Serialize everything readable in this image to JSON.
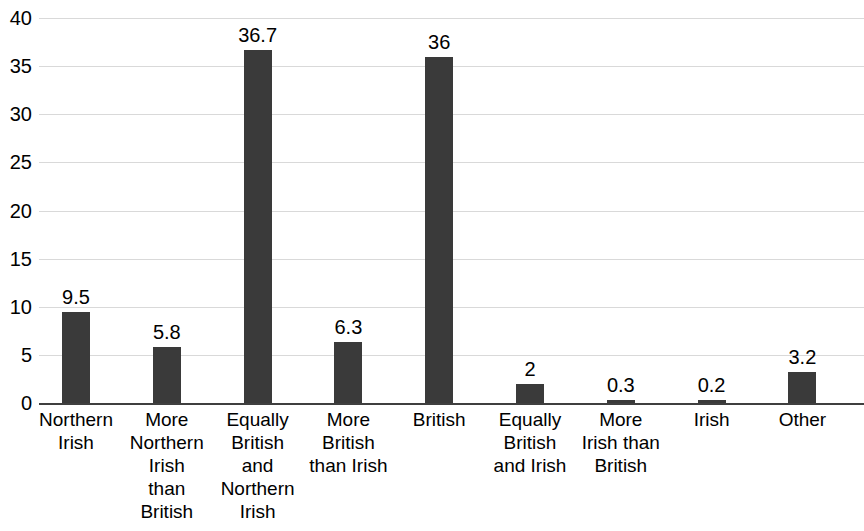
{
  "chart_data": {
    "type": "bar",
    "title": "",
    "subtitle": "",
    "xlabel": "",
    "ylabel": "",
    "ylim": [
      0,
      40
    ],
    "yticks": [
      0,
      5,
      10,
      15,
      20,
      25,
      30,
      35,
      40
    ],
    "ytick_labels": [
      "0",
      "5",
      "10",
      "15",
      "20",
      "25",
      "30",
      "35",
      "40"
    ],
    "grid": true,
    "legend": false,
    "legend_position": "none",
    "bar_color": "#3a3a3a",
    "gridline_color": "#d9d9d9",
    "axis_color": "#3f3f3f",
    "categories": [
      "Northern Irish",
      "More Northern Irish than British",
      "Equally British and Northern Irish",
      "More British than Irish",
      "British",
      "Equally British and Irish",
      "More Irish than British",
      "Irish",
      "Other"
    ],
    "category_lines": [
      [
        "Northern",
        "Irish"
      ],
      [
        "More",
        "Northern",
        "Irish",
        "than",
        "British"
      ],
      [
        "Equally",
        "British",
        "and",
        "Northern",
        "Irish"
      ],
      [
        "More",
        "British",
        "than Irish"
      ],
      [
        "British"
      ],
      [
        "Equally",
        "British",
        "and Irish"
      ],
      [
        "More",
        "Irish than",
        "British"
      ],
      [
        "Irish"
      ],
      [
        "Other"
      ]
    ],
    "values": [
      9.5,
      5.8,
      36.7,
      6.3,
      36,
      2,
      0.3,
      0.2,
      3.2
    ],
    "value_labels": [
      "9.5",
      "5.8",
      "36.7",
      "6.3",
      "36",
      "2",
      "0.3",
      "0.2",
      "3.2"
    ]
  }
}
